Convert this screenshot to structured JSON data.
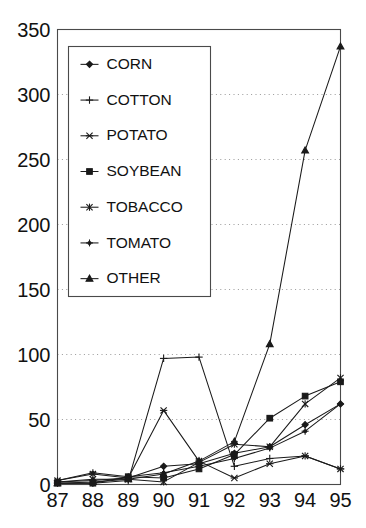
{
  "chart_data": {
    "type": "line",
    "title": "",
    "xlabel": "",
    "ylabel": "",
    "x": [
      "87",
      "88",
      "89",
      "90",
      "91",
      "92",
      "93",
      "94",
      "95"
    ],
    "xlim": [
      0,
      8
    ],
    "ylim": [
      0,
      350
    ],
    "yticks": [
      0,
      50,
      100,
      150,
      200,
      250,
      300,
      350
    ],
    "grid": true,
    "grid_axis": "y",
    "legend_position": "upper-left-inside",
    "series": [
      {
        "name": "CORN",
        "marker": "diamond",
        "values": [
          2,
          3,
          5,
          14,
          16,
          24,
          29,
          46,
          62
        ]
      },
      {
        "name": "COTTON",
        "marker": "plus",
        "values": [
          1,
          1,
          3,
          97,
          98,
          14,
          20,
          22,
          12
        ]
      },
      {
        "name": "POTATO",
        "marker": "asterisk",
        "values": [
          3,
          8,
          5,
          57,
          18,
          5,
          16,
          22,
          12
        ]
      },
      {
        "name": "SOYBEAN",
        "marker": "square",
        "values": [
          1,
          1,
          6,
          5,
          12,
          23,
          51,
          68,
          79
        ]
      },
      {
        "name": "TOBACCO",
        "marker": "star",
        "values": [
          2,
          4,
          4,
          2,
          17,
          31,
          29,
          62,
          82
        ]
      },
      {
        "name": "TOMATO",
        "marker": "plus-dot",
        "values": [
          3,
          9,
          6,
          9,
          14,
          20,
          28,
          41,
          62
        ]
      },
      {
        "name": "OTHER",
        "marker": "triangle",
        "values": [
          1,
          2,
          4,
          8,
          18,
          33,
          108,
          257,
          337
        ]
      }
    ]
  },
  "axes": {
    "y_tick_labels": [
      "0",
      "50",
      "100",
      "150",
      "200",
      "250",
      "300",
      "350"
    ],
    "x_tick_labels": [
      "87",
      "88",
      "89",
      "90",
      "91",
      "92",
      "93",
      "94",
      "95"
    ]
  },
  "legend": {
    "entries": [
      {
        "label": "CORN",
        "marker": "diamond"
      },
      {
        "label": "COTTON",
        "marker": "plus"
      },
      {
        "label": "POTATO",
        "marker": "asterisk"
      },
      {
        "label": "SOYBEAN",
        "marker": "square"
      },
      {
        "label": "TOBACCO",
        "marker": "star"
      },
      {
        "label": "TOMATO",
        "marker": "plus-dot"
      },
      {
        "label": "OTHER",
        "marker": "triangle"
      }
    ]
  },
  "style": {
    "line_color": "#1a1a1a",
    "frame_color": "#4a4a4a",
    "grid_color": "#8d8d8d",
    "background": "#ffffff"
  }
}
